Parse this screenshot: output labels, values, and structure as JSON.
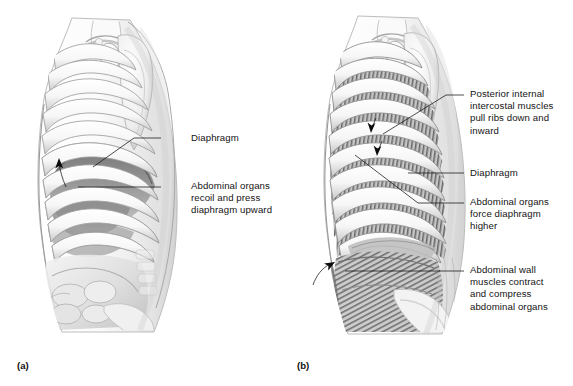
{
  "figure": {
    "background_color": "#ffffff",
    "ink_color": "#141414"
  },
  "panels": [
    {
      "id": "panel-a",
      "caption": "(a)",
      "caption_x": 17,
      "caption_y": 360,
      "view": "lateral thoracic cage with diaphragm and abdominal organs",
      "annotations": [
        {
          "name": "diaphragm",
          "text": "Diaphragm",
          "text_x": 191,
          "text_y": 132,
          "leader_from_x": 161,
          "leader_from_y": 138,
          "leader_to_x": 93,
          "leader_to_y": 167
        },
        {
          "name": "abdominal-organs-recoil",
          "text": "Abdominal organs\nrecoil and press\ndiaphragm upward",
          "text_x": 191,
          "text_y": 180,
          "leader_from_x": 161,
          "leader_from_y": 187,
          "leader_to_x": 78,
          "leader_to_y": 187
        }
      ],
      "arrows": [
        {
          "name": "abdominal-recoil-arrow",
          "direction": "up",
          "tip_x": 59,
          "tip_y": 161,
          "tail_x": 66,
          "tail_y": 186
        }
      ]
    },
    {
      "id": "panel-b",
      "caption": "(b)",
      "caption_x": 297,
      "caption_y": 360,
      "view": "lateral thoracic cage with internal intercostal and abdominal wall muscles",
      "annotations": [
        {
          "name": "posterior-internal-intercostal-muscles",
          "text": "Posterior internal\nintercostal muscles\npull ribs down and\ninward",
          "text_x": 470,
          "text_y": 88,
          "leader_from_x": 464,
          "leader_from_y": 95,
          "leader_to_x": 383,
          "leader_to_y": 134
        },
        {
          "name": "diaphragm",
          "text": "Diaphragm",
          "text_x": 470,
          "text_y": 167,
          "leader_from_x": 464,
          "leader_from_y": 173,
          "leader_to_x": 408,
          "leader_to_y": 173
        },
        {
          "name": "abdominal-organs-force-diaphragm",
          "text": "Abdominal organs\nforce diaphragm\nhigher",
          "text_x": 470,
          "text_y": 196,
          "leader_from_x": 464,
          "leader_from_y": 203,
          "leader_to_x": 355,
          "leader_to_y": 155
        },
        {
          "name": "abdominal-wall-muscles",
          "text": "Abdominal wall\nmuscles contract\nand compress\nabdominal organs",
          "text_x": 470,
          "text_y": 264,
          "leader_from_x": 464,
          "leader_from_y": 271,
          "leader_to_x": 345,
          "leader_to_y": 271
        }
      ],
      "arrows": [
        {
          "name": "intercostal-pull-arrow-upper",
          "direction": "down",
          "tip_x": 371,
          "tip_y": 131,
          "tail_x": 376,
          "tail_y": 118
        },
        {
          "name": "intercostal-pull-arrow-lower",
          "direction": "down",
          "tip_x": 377,
          "tip_y": 154,
          "tail_x": 382,
          "tail_y": 141
        },
        {
          "name": "abdominal-wall-compress-arrow",
          "direction": "up-right-curved",
          "tip_x": 333,
          "tip_y": 262,
          "tail_x": 313,
          "tail_y": 285
        }
      ]
    }
  ]
}
